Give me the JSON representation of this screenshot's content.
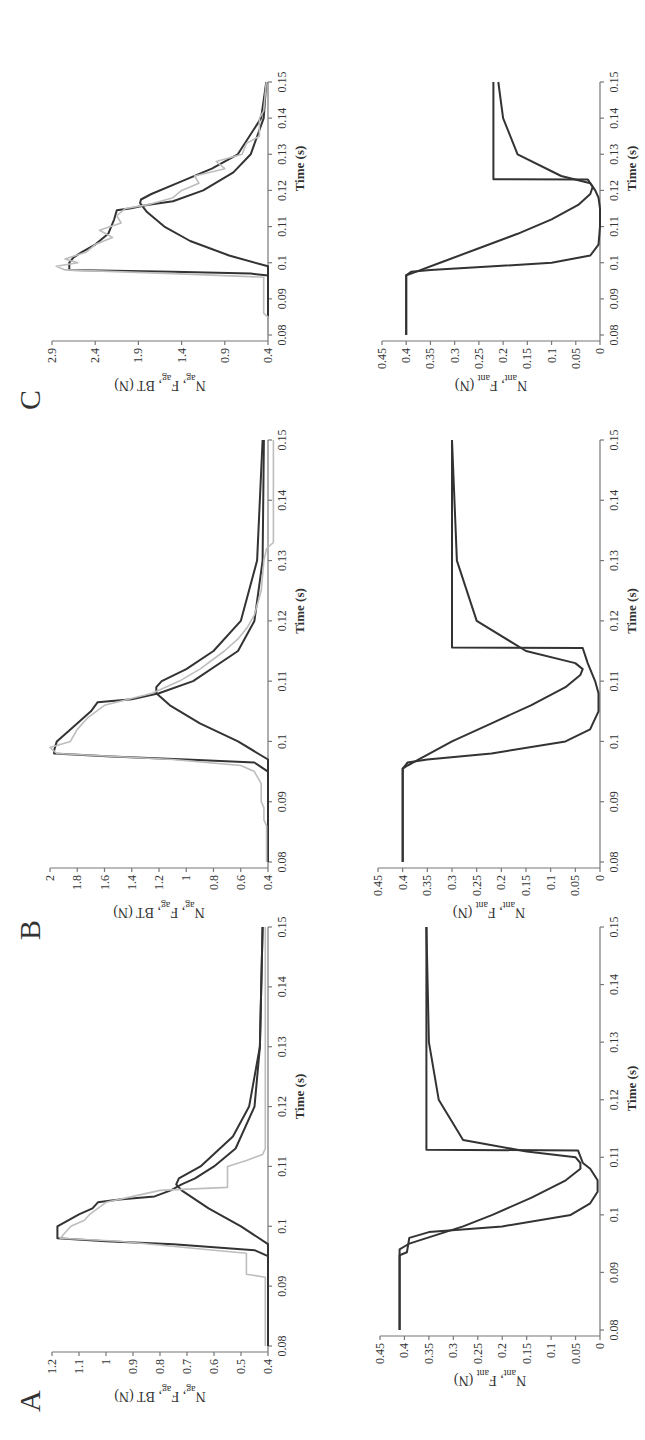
{
  "figure": {
    "orientation": "rotated 90deg counter-clockwise",
    "panels": [
      "A",
      "B",
      "C"
    ]
  },
  "chart_data": [
    {
      "panel": "A",
      "position": "top",
      "type": "line",
      "title": "",
      "xlabel": "Time (s)",
      "ylabel": "N_ag, F_ag, BT (N)",
      "xlim": [
        0.08,
        0.15
      ],
      "ylim": [
        0.4,
        1.2
      ],
      "xticks": [
        "0.08",
        "0.09",
        "0.1",
        "0.11",
        "0.12",
        "0.13",
        "0.14",
        "0.15"
      ],
      "yticks": [
        "0.4",
        "0.5",
        "0.6",
        "0.7",
        "0.8",
        "0.9",
        "1",
        "1.1",
        "1.2"
      ],
      "grid": false,
      "series": [
        {
          "name": "N_ag (model)",
          "color": "#333333",
          "x": [
            0.08,
            0.095,
            0.096,
            0.097,
            0.0975,
            0.098,
            0.1,
            0.102,
            0.103,
            0.104,
            0.1045,
            0.105,
            0.106,
            0.1065,
            0.107,
            0.108,
            0.11,
            0.113,
            0.12,
            0.13,
            0.15
          ],
          "y": [
            0.4,
            0.4,
            0.45,
            0.75,
            1.0,
            1.18,
            1.18,
            1.1,
            1.05,
            1.03,
            0.95,
            0.82,
            0.76,
            0.74,
            0.72,
            0.67,
            0.6,
            0.52,
            0.45,
            0.43,
            0.42
          ]
        },
        {
          "name": "F_ag (model)",
          "color": "#333333",
          "x": [
            0.08,
            0.097,
            0.1,
            0.103,
            0.106,
            0.107,
            0.108,
            0.11,
            0.115,
            0.12,
            0.13,
            0.15
          ],
          "y": [
            0.4,
            0.4,
            0.5,
            0.62,
            0.72,
            0.74,
            0.73,
            0.65,
            0.53,
            0.47,
            0.43,
            0.42
          ]
        },
        {
          "name": "BT (experimental)",
          "color": "#bdbdbd",
          "x": [
            0.08,
            0.0915,
            0.092,
            0.0955,
            0.096,
            0.0975,
            0.098,
            0.099,
            0.1,
            0.101,
            0.102,
            0.104,
            0.105,
            0.106,
            0.1065,
            0.11,
            0.111,
            0.112,
            0.113,
            0.14,
            0.15
          ],
          "y": [
            0.41,
            0.41,
            0.48,
            0.48,
            0.6,
            0.95,
            1.17,
            1.15,
            1.13,
            1.08,
            1.06,
            1.0,
            0.9,
            0.8,
            0.55,
            0.55,
            0.48,
            0.42,
            0.41,
            0.41,
            0.41
          ]
        }
      ]
    },
    {
      "panel": "A",
      "position": "bottom",
      "type": "line",
      "xlabel": "Time (s)",
      "ylabel": "N_ant, F_ant (N)",
      "xlim": [
        0.08,
        0.15
      ],
      "ylim": [
        0,
        0.45
      ],
      "xticks": [
        "0.08",
        "0.09",
        "0.1",
        "0.11",
        "0.12",
        "0.13",
        "0.14",
        "0.15"
      ],
      "yticks": [
        "0",
        "0.05",
        "0.1",
        "0.15",
        "0.2",
        "0.25",
        "0.3",
        "0.35",
        "0.4",
        "0.45"
      ],
      "grid": false,
      "series": [
        {
          "name": "N_ant (model)",
          "color": "#333333",
          "x": [
            0.08,
            0.094,
            0.0945,
            0.095,
            0.098,
            0.1,
            0.103,
            0.106,
            0.108,
            0.109,
            0.11,
            0.111,
            0.113,
            0.12,
            0.13,
            0.15
          ],
          "y": [
            0.41,
            0.41,
            0.4,
            0.39,
            0.28,
            0.22,
            0.14,
            0.07,
            0.04,
            0.04,
            0.05,
            0.15,
            0.28,
            0.33,
            0.35,
            0.355
          ]
        },
        {
          "name": "F_ant (model)",
          "color": "#333333",
          "x": [
            0.08,
            0.093,
            0.0935,
            0.096,
            0.097,
            0.098,
            0.1,
            0.102,
            0.104,
            0.106,
            0.108,
            0.109,
            0.1112,
            0.1113,
            0.15
          ],
          "y": [
            0.41,
            0.41,
            0.395,
            0.39,
            0.35,
            0.2,
            0.06,
            0.02,
            0.005,
            0.005,
            0.02,
            0.035,
            0.045,
            0.355,
            0.355
          ]
        }
      ]
    },
    {
      "panel": "B",
      "position": "top",
      "type": "line",
      "xlabel": "Time (s)",
      "ylabel": "N_ag, F_ag, BT (N)",
      "xlim": [
        0.08,
        0.15
      ],
      "ylim": [
        0.4,
        2.0
      ],
      "xticks": [
        "0.08",
        "0.09",
        "0.1",
        "0.11",
        "0.12",
        "0.13",
        "0.14",
        "0.15"
      ],
      "yticks": [
        "0.4",
        "0.6",
        "0.8",
        "1",
        "1.2",
        "1.4",
        "1.6",
        "1.8",
        "2"
      ],
      "grid": false,
      "series": [
        {
          "name": "N_ag (model)",
          "color": "#333333",
          "x": [
            0.08,
            0.095,
            0.0965,
            0.097,
            0.0975,
            0.098,
            0.0985,
            0.1,
            0.102,
            0.105,
            0.1065,
            0.107,
            0.108,
            0.11,
            0.115,
            0.12,
            0.13,
            0.15
          ],
          "y": [
            0.4,
            0.4,
            0.5,
            1.0,
            1.55,
            1.97,
            1.97,
            1.95,
            1.85,
            1.7,
            1.65,
            1.4,
            1.2,
            0.95,
            0.62,
            0.5,
            0.44,
            0.43
          ]
        },
        {
          "name": "F_ag (model)",
          "color": "#333333",
          "x": [
            0.08,
            0.097,
            0.1,
            0.103,
            0.106,
            0.108,
            0.109,
            0.11,
            0.112,
            0.115,
            0.12,
            0.13,
            0.15
          ],
          "y": [
            0.4,
            0.4,
            0.62,
            0.9,
            1.12,
            1.22,
            1.22,
            1.18,
            1.0,
            0.8,
            0.6,
            0.48,
            0.44
          ]
        },
        {
          "name": "BT (experimental)",
          "color": "#bdbdbd",
          "x": [
            0.08,
            0.086,
            0.087,
            0.089,
            0.09,
            0.093,
            0.095,
            0.096,
            0.097,
            0.098,
            0.099,
            0.1,
            0.102,
            0.104,
            0.106,
            0.108,
            0.11,
            0.112,
            0.115,
            0.117,
            0.119,
            0.121,
            0.125,
            0.13,
            0.132,
            0.133,
            0.15
          ],
          "y": [
            0.41,
            0.41,
            0.43,
            0.43,
            0.45,
            0.45,
            0.5,
            0.6,
            1.1,
            1.95,
            2.0,
            1.85,
            1.8,
            1.72,
            1.6,
            1.25,
            1.05,
            0.9,
            0.72,
            0.62,
            0.55,
            0.5,
            0.45,
            0.43,
            0.41,
            0.36,
            0.36
          ]
        }
      ]
    },
    {
      "panel": "B",
      "position": "bottom",
      "type": "line",
      "xlabel": "Time (s)",
      "ylabel": "N_ant, F_ant (N)",
      "xlim": [
        0.08,
        0.15
      ],
      "ylim": [
        0,
        0.45
      ],
      "xticks": [
        "0.08",
        "0.09",
        "0.1",
        "0.11",
        "0.12",
        "0.13",
        "0.14",
        "0.15"
      ],
      "yticks": [
        "0",
        "0.05",
        "0.1",
        "0.15",
        "0.2",
        "0.25",
        "0.3",
        "0.35",
        "0.4",
        "0.45"
      ],
      "grid": false,
      "series": [
        {
          "name": "N_ant (model)",
          "color": "#333333",
          "x": [
            0.08,
            0.0955,
            0.096,
            0.1,
            0.103,
            0.106,
            0.109,
            0.111,
            0.112,
            0.113,
            0.115,
            0.12,
            0.13,
            0.15
          ],
          "y": [
            0.4,
            0.4,
            0.39,
            0.3,
            0.22,
            0.14,
            0.07,
            0.04,
            0.035,
            0.05,
            0.15,
            0.25,
            0.29,
            0.3
          ]
        },
        {
          "name": "F_ant (model)",
          "color": "#333333",
          "x": [
            0.08,
            0.0955,
            0.0965,
            0.097,
            0.098,
            0.1,
            0.102,
            0.105,
            0.108,
            0.11,
            0.113,
            0.1155,
            0.1156,
            0.15
          ],
          "y": [
            0.4,
            0.4,
            0.39,
            0.35,
            0.22,
            0.07,
            0.02,
            0.003,
            0.003,
            0.01,
            0.025,
            0.035,
            0.3,
            0.3
          ]
        }
      ]
    },
    {
      "panel": "C",
      "position": "top",
      "type": "line",
      "xlabel": "Time (s)",
      "ylabel": "N_ag, F_ag, BT (N)",
      "xlim": [
        0.08,
        0.15
      ],
      "ylim": [
        0.4,
        2.9
      ],
      "xticks": [
        "0.08",
        "0.09",
        "0.1",
        "0.11",
        "0.12",
        "0.13",
        "0.14",
        "0.15"
      ],
      "yticks": [
        "0.4",
        "0.9",
        "1.4",
        "1.9",
        "2.4",
        "2.9"
      ],
      "grid": false,
      "series": [
        {
          "name": "N_ag (model)",
          "color": "#333333",
          "x": [
            0.08,
            0.0965,
            0.097,
            0.0975,
            0.098,
            0.1,
            0.1015,
            0.103,
            0.105,
            0.108,
            0.112,
            0.1145,
            0.115,
            0.116,
            0.117,
            0.12,
            0.125,
            0.13,
            0.14,
            0.15
          ],
          "y": [
            0.4,
            0.4,
            0.6,
            1.5,
            2.7,
            2.7,
            2.65,
            2.55,
            2.4,
            2.25,
            2.18,
            2.15,
            2.0,
            1.8,
            1.5,
            1.15,
            0.8,
            0.6,
            0.45,
            0.42
          ]
        },
        {
          "name": "F_ag (model)",
          "color": "#333333",
          "x": [
            0.08,
            0.099,
            0.102,
            0.106,
            0.11,
            0.114,
            0.1165,
            0.1175,
            0.119,
            0.122,
            0.126,
            0.13,
            0.14,
            0.15
          ],
          "y": [
            0.4,
            0.4,
            0.85,
            1.3,
            1.6,
            1.8,
            1.88,
            1.87,
            1.75,
            1.45,
            1.05,
            0.75,
            0.48,
            0.42
          ]
        },
        {
          "name": "BT (experimental)",
          "color": "#bdbdbd",
          "x": [
            0.08,
            0.085,
            0.086,
            0.096,
            0.097,
            0.098,
            0.099,
            0.1,
            0.101,
            0.103,
            0.105,
            0.107,
            0.109,
            0.111,
            0.113,
            0.115,
            0.116,
            0.118,
            0.12,
            0.122,
            0.124,
            0.126,
            0.128,
            0.13,
            0.133,
            0.135,
            0.14,
            0.142,
            0.15
          ],
          "y": [
            0.4,
            0.4,
            0.45,
            0.45,
            1.5,
            2.75,
            2.85,
            2.6,
            2.75,
            2.5,
            2.4,
            2.2,
            2.35,
            2.1,
            2.15,
            2.05,
            1.8,
            1.5,
            1.4,
            1.2,
            1.25,
            0.9,
            1.0,
            0.7,
            0.65,
            0.5,
            0.5,
            0.45,
            0.42
          ]
        }
      ]
    },
    {
      "panel": "C",
      "position": "bottom",
      "type": "line",
      "xlabel": "Time (s)",
      "ylabel": "N_ant, F_ant (N)",
      "xlim": [
        0.08,
        0.15
      ],
      "ylim": [
        0,
        0.45
      ],
      "xticks": [
        "0.08",
        "0.09",
        "0.1",
        "0.11",
        "0.12",
        "0.13",
        "0.14",
        "0.15"
      ],
      "yticks": [
        "0",
        "0.05",
        "0.1",
        "0.15",
        "0.2",
        "0.25",
        "0.3",
        "0.35",
        "0.4",
        "0.45"
      ],
      "grid": false,
      "series": [
        {
          "name": "N_ant (model)",
          "color": "#333333",
          "x": [
            0.08,
            0.0965,
            0.097,
            0.1,
            0.104,
            0.108,
            0.112,
            0.116,
            0.119,
            0.121,
            0.122,
            0.124,
            0.13,
            0.14,
            0.15
          ],
          "y": [
            0.4,
            0.4,
            0.39,
            0.33,
            0.25,
            0.17,
            0.1,
            0.045,
            0.02,
            0.015,
            0.02,
            0.08,
            0.17,
            0.2,
            0.21
          ]
        },
        {
          "name": "F_ant (model)",
          "color": "#333333",
          "x": [
            0.08,
            0.0965,
            0.0975,
            0.098,
            0.099,
            0.1,
            0.102,
            0.105,
            0.11,
            0.115,
            0.118,
            0.12,
            0.122,
            0.123,
            0.1231,
            0.15
          ],
          "y": [
            0.4,
            0.4,
            0.39,
            0.35,
            0.22,
            0.1,
            0.02,
            0.003,
            0.0,
            0.0,
            0.003,
            0.01,
            0.02,
            0.025,
            0.22,
            0.22
          ]
        }
      ]
    }
  ],
  "labels": {
    "panel_a": "A",
    "panel_b": "B",
    "panel_c": "C",
    "xlabel": "Time (s)",
    "ylabel_top_main": "N",
    "ylabel_top_sub1": "ag",
    "ylabel_top_mid": ", F",
    "ylabel_top_sub2": "ag",
    "ylabel_top_end": ", BT (N)",
    "ylabel_bot_main": "N",
    "ylabel_bot_sub1": "ant",
    "ylabel_bot_mid": ", F",
    "ylabel_bot_sub2": "ant",
    "ylabel_bot_end": " (N)"
  },
  "colors": {
    "model": "#333333",
    "experimental": "#bdbdbd",
    "axis": "#777777"
  }
}
